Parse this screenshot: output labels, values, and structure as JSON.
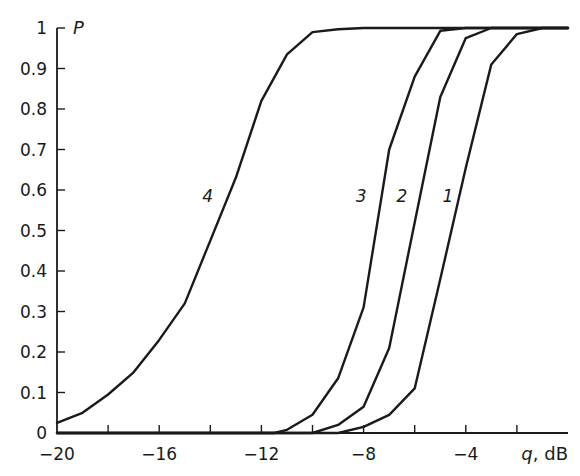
{
  "chart_data": {
    "type": "line",
    "title": "",
    "xlabel": "q, dB",
    "xlabel_var": "q",
    "xlabel_unit": ", dB",
    "ylabel": "P",
    "xlim": [
      -20,
      0
    ],
    "ylim": [
      0,
      1
    ],
    "grid": false,
    "legend": "inline curve labels",
    "x_ticks": [
      -20,
      -18,
      -16,
      -14,
      -12,
      -10,
      -8,
      -6,
      -4,
      -2,
      0
    ],
    "x_tick_labels": [
      {
        "value": -20,
        "label": "−20"
      },
      {
        "value": -16,
        "label": "−16"
      },
      {
        "value": -12,
        "label": "−12"
      },
      {
        "value": -8,
        "label": "−8"
      },
      {
        "value": -4,
        "label": "−4"
      }
    ],
    "y_ticks": [
      0,
      0.1,
      0.2,
      0.3,
      0.4,
      0.5,
      0.6,
      0.7,
      0.8,
      0.9,
      1
    ],
    "y_tick_labels": [
      "0",
      "0.1",
      "0.2",
      "0.3",
      "0.4",
      "0.5",
      "0.6",
      "0.7",
      "0.8",
      "0.9",
      "1"
    ],
    "series": [
      {
        "name": "1",
        "label_pos": {
          "q": -4.7,
          "P": 0.57
        },
        "x": [
          -20,
          -9,
          -8,
          -7,
          -6,
          -5,
          -4,
          -3,
          -2,
          -1,
          0
        ],
        "values": [
          0,
          0,
          0.015,
          0.045,
          0.11,
          0.38,
          0.655,
          0.91,
          0.985,
          1,
          1
        ]
      },
      {
        "name": "2",
        "label_pos": {
          "q": -6.5,
          "P": 0.57
        },
        "x": [
          -20,
          -10,
          -9,
          -8,
          -7,
          -6,
          -5,
          -4,
          -3,
          0
        ],
        "values": [
          0,
          0,
          0.02,
          0.065,
          0.21,
          0.52,
          0.83,
          0.975,
          1,
          1
        ]
      },
      {
        "name": "3",
        "label_pos": {
          "q": -8.1,
          "P": 0.57
        },
        "x": [
          -20,
          -11.5,
          -11,
          -10,
          -9,
          -8,
          -7,
          -6,
          -5,
          -4,
          0
        ],
        "values": [
          0,
          0,
          0.008,
          0.045,
          0.135,
          0.31,
          0.7,
          0.88,
          0.993,
          1,
          1
        ]
      },
      {
        "name": "4",
        "label_pos": {
          "q": -14.1,
          "P": 0.57
        },
        "x": [
          -20,
          -19,
          -18,
          -17,
          -16,
          -15,
          -14,
          -13,
          -12,
          -11,
          -10,
          -9,
          -8,
          0
        ],
        "values": [
          0.025,
          0.05,
          0.095,
          0.15,
          0.23,
          0.32,
          0.475,
          0.63,
          0.82,
          0.935,
          0.99,
          0.997,
          1,
          1
        ]
      }
    ]
  }
}
